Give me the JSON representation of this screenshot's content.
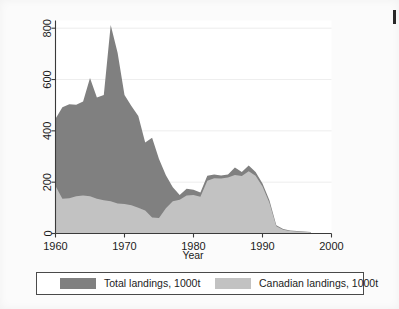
{
  "figure": {
    "background_color": "#fbfbfb",
    "plot_background_color": "#ffffff"
  },
  "axes": {
    "y_ticks": [
      "0",
      "200",
      "400",
      "600",
      "800"
    ],
    "x_ticks": [
      "1960",
      "1970",
      "1980",
      "1990",
      "2000"
    ],
    "x_title": "Year"
  },
  "legend": {
    "entries": [
      {
        "label": "Total landings, 1000t",
        "color": "#808080",
        "key_name": "total-landings"
      },
      {
        "label": "Canadian landings, 1000t",
        "color": "#c2c2c2",
        "key_name": "canadian-landings"
      }
    ]
  },
  "chart_data": {
    "type": "area",
    "title": "",
    "subtitle": "",
    "xlabel": "Year",
    "ylabel": "",
    "xlim": [
      1960,
      2000
    ],
    "ylim": [
      0,
      830
    ],
    "grid": true,
    "grid_axis": "y",
    "legend_position": "bottom",
    "x": [
      1960,
      1961,
      1962,
      1963,
      1964,
      1965,
      1966,
      1967,
      1968,
      1969,
      1970,
      1971,
      1972,
      1973,
      1974,
      1975,
      1976,
      1977,
      1978,
      1979,
      1980,
      1981,
      1982,
      1983,
      1984,
      1985,
      1986,
      1987,
      1988,
      1989,
      1990,
      1991,
      1992,
      1993,
      1994,
      1995,
      1996,
      1997
    ],
    "series": [
      {
        "name": "Total landings, 1000t",
        "color": "#808080",
        "values": [
          447,
          492,
          504,
          502,
          514,
          606,
          530,
          540,
          812,
          704,
          540,
          497,
          458,
          355,
          373,
          290,
          227,
          180,
          150,
          174,
          170,
          160,
          225,
          230,
          226,
          230,
          257,
          240,
          265,
          240,
          195,
          130,
          32,
          18,
          12,
          10,
          8,
          6
        ]
      },
      {
        "name": "Canadian landings, 1000t",
        "color": "#c2c2c2",
        "values": [
          185,
          135,
          137,
          145,
          148,
          145,
          135,
          130,
          126,
          117,
          115,
          110,
          100,
          90,
          62,
          60,
          98,
          126,
          132,
          148,
          150,
          143,
          206,
          215,
          214,
          218,
          228,
          224,
          243,
          225,
          183,
          120,
          28,
          15,
          10,
          8,
          7,
          5
        ]
      }
    ]
  }
}
